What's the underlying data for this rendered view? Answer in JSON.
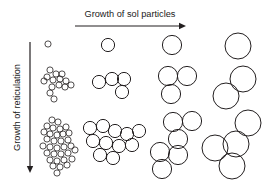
{
  "figure": {
    "title_top": "Growth of sol particles",
    "title_left": "Growth of reticulation",
    "background_color": "#ffffff",
    "stroke_color": "#231f20",
    "arrow_color": "#231f20"
  },
  "axes": {
    "horizontal": {
      "label": "Growth of sol particles",
      "direction": "right",
      "x_start": 75,
      "x_end": 186,
      "y": 26
    },
    "vertical": {
      "label": "Growth of reticulation",
      "direction": "down",
      "x": 30,
      "y_start": 42,
      "y_end": 173
    }
  },
  "grid": {
    "columns": 4,
    "rows": 3,
    "column_meaning": "increasing sol particle size",
    "row_meaning": "increasing reticulation / aggregation"
  },
  "chart_data": {
    "type": "diagram",
    "xlabel": "Growth of sol particles",
    "ylabel": "Growth of reticulation",
    "cells": [
      {
        "row": 1,
        "col": 1,
        "particle_radius": 3.1,
        "count": 1,
        "circles": [
          [
            48,
            44,
            3.1
          ]
        ]
      },
      {
        "row": 1,
        "col": 2,
        "particle_radius": 6.6,
        "count": 1,
        "circles": [
          [
            108,
            45,
            6.6
          ]
        ]
      },
      {
        "row": 1,
        "col": 3,
        "particle_radius": 9.6,
        "count": 1,
        "circles": [
          [
            172,
            45,
            9.6
          ]
        ]
      },
      {
        "row": 1,
        "col": 4,
        "particle_radius": 13.0,
        "count": 1,
        "circles": [
          [
            238,
            46,
            13.0
          ]
        ]
      },
      {
        "row": 2,
        "col": 1,
        "particle_radius": 3.1,
        "count": 14,
        "circles": [
          [
            50,
            70,
            3.1
          ],
          [
            56,
            74,
            3.1
          ],
          [
            47,
            77,
            3.1
          ],
          [
            53,
            80,
            3.1
          ],
          [
            60,
            79,
            3.1
          ],
          [
            66,
            81,
            3.1
          ],
          [
            59,
            85,
            3.1
          ],
          [
            65,
            87,
            3.1
          ],
          [
            71,
            85,
            3.1
          ],
          [
            52,
            87,
            3.1
          ],
          [
            50,
            93,
            3.1
          ],
          [
            54,
            99,
            3.1
          ],
          [
            44,
            81,
            3.1
          ],
          [
            62,
            74,
            3.1
          ]
        ]
      },
      {
        "row": 2,
        "col": 2,
        "particle_radius": 6.6,
        "count": 4,
        "circles": [
          [
            99,
            82,
            6.6
          ],
          [
            112,
            79,
            6.6
          ],
          [
            124,
            79,
            6.6
          ],
          [
            122,
            92,
            6.6
          ]
        ]
      },
      {
        "row": 2,
        "col": 3,
        "particle_radius": 9.6,
        "count": 3,
        "circles": [
          [
            168,
            76,
            9.6
          ],
          [
            187,
            76,
            9.6
          ],
          [
            171,
            94,
            9.6
          ]
        ]
      },
      {
        "row": 2,
        "col": 4,
        "particle_radius": 13.0,
        "count": 2,
        "circles": [
          [
            243,
            79,
            13.0
          ],
          [
            226,
            96,
            13.0
          ]
        ]
      },
      {
        "row": 3,
        "col": 1,
        "particle_radius": 3.1,
        "count": 33,
        "circles": [
          [
            52,
            120,
            3.1
          ],
          [
            58,
            122,
            3.1
          ],
          [
            47,
            126,
            3.1
          ],
          [
            53,
            128,
            3.1
          ],
          [
            60,
            129,
            3.1
          ],
          [
            66,
            127,
            3.1
          ],
          [
            44,
            132,
            3.1
          ],
          [
            50,
            134,
            3.1
          ],
          [
            57,
            135,
            3.1
          ],
          [
            63,
            134,
            3.1
          ],
          [
            69,
            133,
            3.1
          ],
          [
            47,
            139,
            3.1
          ],
          [
            54,
            141,
            3.1
          ],
          [
            61,
            141,
            3.1
          ],
          [
            68,
            140,
            3.1
          ],
          [
            43,
            146,
            3.1
          ],
          [
            50,
            147,
            3.1
          ],
          [
            57,
            148,
            3.1
          ],
          [
            64,
            147,
            3.1
          ],
          [
            71,
            146,
            3.1
          ],
          [
            47,
            153,
            3.1
          ],
          [
            54,
            154,
            3.1
          ],
          [
            61,
            154,
            3.1
          ],
          [
            68,
            153,
            3.1
          ],
          [
            75,
            150,
            3.1
          ],
          [
            50,
            160,
            3.1
          ],
          [
            57,
            161,
            3.1
          ],
          [
            64,
            160,
            3.1
          ],
          [
            53,
            166,
            3.1
          ],
          [
            60,
            167,
            3.1
          ],
          [
            67,
            165,
            3.1
          ],
          [
            57,
            173,
            3.1
          ],
          [
            72,
            159,
            3.1
          ]
        ]
      },
      {
        "row": 3,
        "col": 2,
        "particle_radius": 6.6,
        "count": 11,
        "circles": [
          [
            90,
            128,
            6.6
          ],
          [
            103,
            126,
            6.6
          ],
          [
            115,
            131,
            6.6
          ],
          [
            127,
            134,
            6.6
          ],
          [
            139,
            131,
            6.6
          ],
          [
            132,
            145,
            6.6
          ],
          [
            93,
            141,
            6.6
          ],
          [
            106,
            143,
            6.6
          ],
          [
            119,
            146,
            6.6
          ],
          [
            100,
            155,
            6.6
          ],
          [
            113,
            158,
            6.6
          ]
        ]
      },
      {
        "row": 3,
        "col": 3,
        "particle_radius": 9.6,
        "count": 6,
        "circles": [
          [
            173,
            122,
            9.6
          ],
          [
            192,
            121,
            9.6
          ],
          [
            178,
            139,
            9.6
          ],
          [
            160,
            152,
            9.6
          ],
          [
            178,
            155,
            9.6
          ],
          [
            162,
            169,
            9.6
          ]
        ]
      },
      {
        "row": 3,
        "col": 4,
        "particle_radius": 13.0,
        "count": 4,
        "circles": [
          [
            248,
            123,
            13.0
          ],
          [
            236,
            144,
            13.0
          ],
          [
            215,
            148,
            13.0
          ],
          [
            232,
            166,
            13.0
          ]
        ]
      }
    ]
  }
}
